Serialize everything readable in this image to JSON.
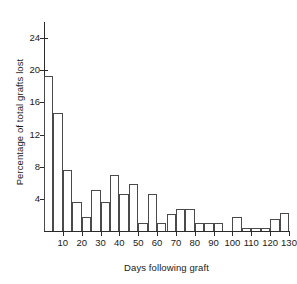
{
  "chart_data": {
    "type": "bar",
    "title": "",
    "subtitle": "",
    "xlabel": "Days following graft",
    "ylabel": "Percentage of total grafts lost",
    "xlim": [
      0,
      130
    ],
    "ylim": [
      0,
      26
    ],
    "grid": false,
    "legend": null,
    "bin_width": 5,
    "x_tick_labels": [
      "10",
      "20",
      "30",
      "40",
      "50",
      "60",
      "70",
      "80",
      "90",
      "100",
      "110",
      "120",
      "130"
    ],
    "x_tick_values": [
      10,
      20,
      30,
      40,
      50,
      60,
      70,
      80,
      90,
      100,
      110,
      120,
      130
    ],
    "y_tick_labels": [
      "4",
      "8",
      "12",
      "16",
      "20",
      "24"
    ],
    "y_tick_values": [
      4,
      8,
      12,
      16,
      20,
      24
    ],
    "categories": [
      "0-5",
      "5-10",
      "10-15",
      "15-20",
      "20-25",
      "25-30",
      "30-35",
      "35-40",
      "40-45",
      "45-50",
      "50-55",
      "55-60",
      "60-65",
      "65-70",
      "70-75",
      "75-80",
      "80-85",
      "85-90",
      "90-95",
      "95-100",
      "100-105",
      "105-110",
      "110-115",
      "115-120",
      "120-125",
      "125-130"
    ],
    "bin_starts": [
      0,
      5,
      10,
      15,
      20,
      25,
      30,
      35,
      40,
      45,
      50,
      55,
      60,
      65,
      70,
      75,
      80,
      85,
      90,
      95,
      100,
      105,
      110,
      115,
      120,
      125
    ],
    "values": [
      19.3,
      14.7,
      7.6,
      3.6,
      1.7,
      5.1,
      3.6,
      7.0,
      4.6,
      5.8,
      1.0,
      4.6,
      1.0,
      2.1,
      2.7,
      2.7,
      1.0,
      1.0,
      1.0,
      0.0,
      1.7,
      0.4,
      0.4,
      0.4,
      1.5,
      2.2
    ]
  },
  "colors": {
    "axis": "#2b2b2b",
    "bar_stroke": "#4a4a4a",
    "bar_fill": "#ffffff",
    "background": "#ffffff",
    "text": "#1a1a1a"
  }
}
